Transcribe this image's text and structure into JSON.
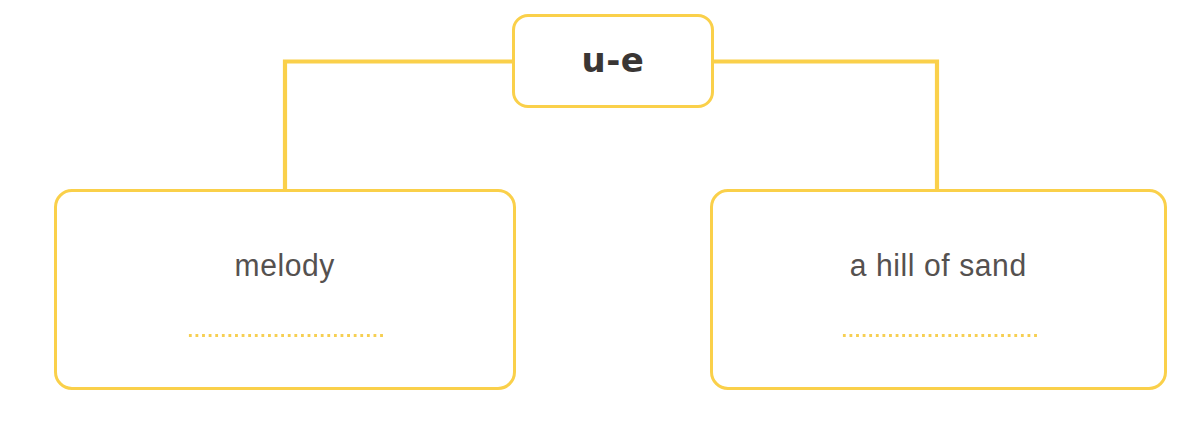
{
  "page": {
    "background_color": "#ffffff",
    "accent_color": "#fad04a",
    "dot_color": "#f6cf52",
    "root_text_color": "#3a3634",
    "answer_text_color": "#55514f",
    "width": 1192,
    "height": 421
  },
  "diagram": {
    "type": "tree",
    "root": {
      "label": "u-e",
      "name": "root-node"
    },
    "branches": [
      {
        "name": "left-branch",
        "label": "melody",
        "writing_line": true
      },
      {
        "name": "right-branch",
        "label": "a hill of sand",
        "writing_line": true
      }
    ],
    "connectors": [
      {
        "name": "connector-left",
        "from": "root-node",
        "to": "left-branch"
      },
      {
        "name": "connector-right",
        "from": "root-node",
        "to": "right-branch"
      }
    ]
  }
}
